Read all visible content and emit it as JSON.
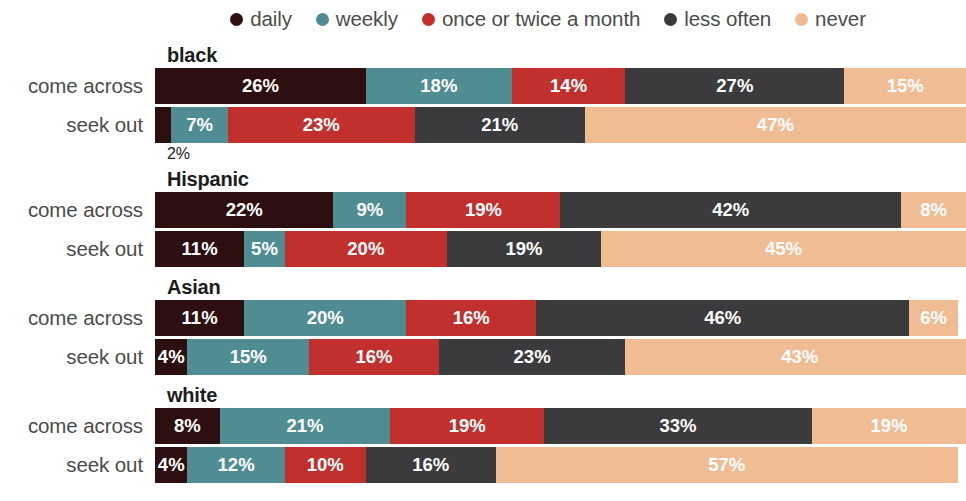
{
  "colors": {
    "daily": "#2d0f0f",
    "weekly": "#4f8d93",
    "once_twice": "#c2302e",
    "less_often": "#3b3b3d",
    "never": "#f0bc94",
    "background": "#ffffff",
    "label_text": "#4c4c4c",
    "title_text": "#1c1c1c",
    "value_text": "#ffffff"
  },
  "legend": {
    "items": [
      {
        "label": "daily",
        "color_key": "daily",
        "icon": "legend-dot-daily"
      },
      {
        "label": "weekly",
        "color_key": "weekly",
        "icon": "legend-dot-weekly"
      },
      {
        "label": "once or twice a month",
        "color_key": "once_twice",
        "icon": "legend-dot-once-twice"
      },
      {
        "label": "less often",
        "color_key": "less_often",
        "icon": "legend-dot-less-often"
      },
      {
        "label": "never",
        "color_key": "never",
        "icon": "legend-dot-never"
      }
    ]
  },
  "row_labels": {
    "come_across": "come across",
    "seek_out": "seek out"
  },
  "annotations": {
    "black_seek_out_daily": "2%"
  },
  "groups": [
    {
      "title": "black",
      "rows": [
        {
          "label": "come across",
          "values": [
            26,
            18,
            14,
            27,
            15
          ],
          "display": [
            "26%",
            "18%",
            "14%",
            "27%",
            "15%"
          ],
          "label_visible": [
            true,
            true,
            true,
            true,
            true
          ]
        },
        {
          "label": "seek out",
          "values": [
            2,
            7,
            23,
            21,
            47
          ],
          "display": [
            "2%",
            "7%",
            "23%",
            "21%",
            "47%"
          ],
          "label_visible": [
            false,
            true,
            true,
            true,
            true
          ]
        }
      ]
    },
    {
      "title": "Hispanic",
      "rows": [
        {
          "label": "come across",
          "values": [
            22,
            9,
            19,
            42,
            8
          ],
          "display": [
            "22%",
            "9%",
            "19%",
            "42%",
            "8%"
          ],
          "label_visible": [
            true,
            true,
            true,
            true,
            true
          ]
        },
        {
          "label": "seek out",
          "values": [
            11,
            5,
            20,
            19,
            45
          ],
          "display": [
            "11%",
            "5%",
            "20%",
            "19%",
            "45%"
          ],
          "label_visible": [
            true,
            true,
            true,
            true,
            true
          ]
        }
      ]
    },
    {
      "title": "Asian",
      "rows": [
        {
          "label": "come across",
          "values": [
            11,
            20,
            16,
            46,
            6
          ],
          "display": [
            "11%",
            "20%",
            "16%",
            "46%",
            "6%"
          ],
          "label_visible": [
            true,
            true,
            true,
            true,
            true
          ]
        },
        {
          "label": "seek out",
          "values": [
            4,
            15,
            16,
            23,
            43
          ],
          "display": [
            "4%",
            "15%",
            "16%",
            "23%",
            "43%"
          ],
          "label_visible": [
            true,
            true,
            true,
            true,
            true
          ]
        }
      ]
    },
    {
      "title": "white",
      "rows": [
        {
          "label": "come across",
          "values": [
            8,
            21,
            19,
            33,
            19
          ],
          "display": [
            "8%",
            "21%",
            "19%",
            "33%",
            "19%"
          ],
          "label_visible": [
            true,
            true,
            true,
            true,
            true
          ]
        },
        {
          "label": "seek out",
          "values": [
            4,
            12,
            10,
            16,
            57
          ],
          "display": [
            "4%",
            "12%",
            "10%",
            "16%",
            "57%"
          ],
          "label_visible": [
            true,
            true,
            true,
            true,
            true
          ]
        }
      ]
    }
  ],
  "chart_data": {
    "type": "bar",
    "title": "",
    "subtitle": "",
    "xlabel": "",
    "ylabel": "",
    "orientation": "horizontal",
    "stacked": true,
    "normalized": true,
    "xlim": [
      0,
      100
    ],
    "grid": false,
    "legend_position": "top",
    "legend_entries": [
      "daily",
      "weekly",
      "once or twice a month",
      "less often",
      "never"
    ],
    "series": [
      {
        "name": "daily",
        "color": "#2d0f0f",
        "values": [
          26,
          2,
          22,
          11,
          11,
          4,
          8,
          4
        ]
      },
      {
        "name": "weekly",
        "color": "#4f8d93",
        "values": [
          18,
          7,
          9,
          5,
          20,
          15,
          21,
          12
        ]
      },
      {
        "name": "once or twice a month",
        "color": "#c2302e",
        "values": [
          14,
          23,
          19,
          20,
          16,
          16,
          19,
          10
        ]
      },
      {
        "name": "less often",
        "color": "#3b3b3d",
        "values": [
          27,
          21,
          42,
          19,
          46,
          23,
          33,
          16
        ]
      },
      {
        "name": "never",
        "color": "#f0bc94",
        "values": [
          15,
          47,
          8,
          45,
          6,
          43,
          19,
          57
        ]
      }
    ],
    "categories": [
      "black — come across",
      "black — seek out",
      "Hispanic — come across",
      "Hispanic — seek out",
      "Asian — come across",
      "Asian — seek out",
      "white — come across",
      "white — seek out"
    ],
    "group_labels": [
      "black",
      "Hispanic",
      "Asian",
      "white"
    ],
    "row_labels": [
      "come across",
      "seek out"
    ],
    "annotations": [
      {
        "text": "2%",
        "for": "black — seek out / daily",
        "position": "below-left"
      }
    ]
  }
}
